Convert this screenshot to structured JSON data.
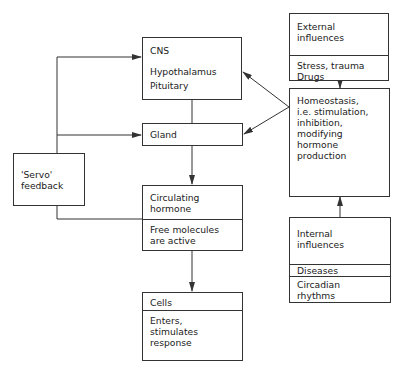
{
  "diagram": {
    "type": "flow",
    "nodes": {
      "cns": {
        "title": "CNS",
        "lines": [
          "Hypothalamus",
          "Pituitary"
        ]
      },
      "gland": {
        "title": "Gland"
      },
      "circulating": {
        "title": "Circulating\nhormone",
        "sub": "Free molecules\nare active"
      },
      "cells": {
        "title": "Cells",
        "sub": "Enters,\nstimulates\nresponse"
      },
      "servo": {
        "title": "'Servo'\nfeedback"
      },
      "external": {
        "title": "External\ninfluences",
        "sub": "Stress, trauma\nDrugs"
      },
      "homeostasis": {
        "title": "Homeostasis,\ni.e. stimulation,\ninhibition,\nmodifying\nhormone\nproduction"
      },
      "internal": {
        "title": "Internal\ninfluences",
        "sub1": "Diseases",
        "sub2": "Circadian\nrhythms"
      }
    },
    "edges": [
      {
        "from": "servo",
        "to": "cns"
      },
      {
        "from": "servo",
        "to": "gland"
      },
      {
        "from": "circulating",
        "to": "servo"
      },
      {
        "from": "cns",
        "to": "gland"
      },
      {
        "from": "gland",
        "to": "circulating"
      },
      {
        "from": "circulating",
        "to": "cells"
      },
      {
        "from": "homeostasis",
        "to": "cns"
      },
      {
        "from": "homeostasis",
        "to": "gland"
      },
      {
        "from": "external",
        "to": "homeostasis"
      },
      {
        "from": "internal",
        "to": "homeostasis"
      }
    ],
    "colors": {
      "line": "#333333",
      "background": "#ffffff",
      "text": "#222222"
    }
  }
}
